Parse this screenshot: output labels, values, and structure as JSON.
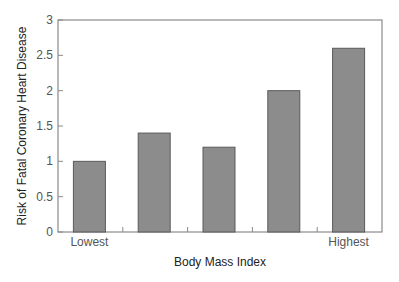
{
  "chart_data": {
    "type": "bar",
    "title": "",
    "xlabel": "Body Mass Index",
    "ylabel": "Risk of Fatal Coronary Heart Disease",
    "categories": [
      "Lowest",
      "",
      "",
      "",
      "Highest"
    ],
    "values": [
      1.0,
      1.4,
      1.2,
      2.0,
      2.6
    ],
    "ylim": [
      0,
      3
    ],
    "yticks": [
      0,
      0.5,
      1,
      1.5,
      2,
      2.5,
      3
    ],
    "ytick_labels": [
      "0",
      "0.5",
      "1",
      "1.5",
      "2",
      "2.5",
      "3"
    ],
    "grid": false,
    "legend": null,
    "bar_color": "#8c8c8c",
    "bar_edge_color": "#5a5a5a",
    "frame_color": "#8a8a8a"
  }
}
